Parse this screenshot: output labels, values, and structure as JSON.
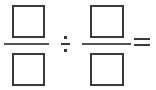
{
  "page": {
    "background_color": "#ffffff",
    "ink_color": "#3a3a3a",
    "rule_color": "#555555",
    "expression": "□/□ ÷ □/□ ="
  },
  "expression": {
    "fraction_left": {
      "name": "first-fraction",
      "numerator": {
        "type": "answer-box",
        "value": "",
        "label": "numerator-box"
      },
      "denominator": {
        "type": "answer-box",
        "value": "",
        "label": "denominator-box"
      },
      "bar": {
        "name": "fraction-bar",
        "symbol": "—"
      }
    },
    "operator": {
      "name": "division-operator",
      "symbol": "÷",
      "label": "divided by"
    },
    "fraction_right": {
      "name": "second-fraction",
      "numerator": {
        "type": "answer-box",
        "value": "",
        "label": "numerator-box"
      },
      "denominator": {
        "type": "answer-box",
        "value": "",
        "label": "denominator-box"
      },
      "bar": {
        "name": "fraction-bar",
        "symbol": "—"
      }
    },
    "equals": {
      "name": "equals-operator",
      "symbol": "=",
      "label": "equals"
    }
  }
}
